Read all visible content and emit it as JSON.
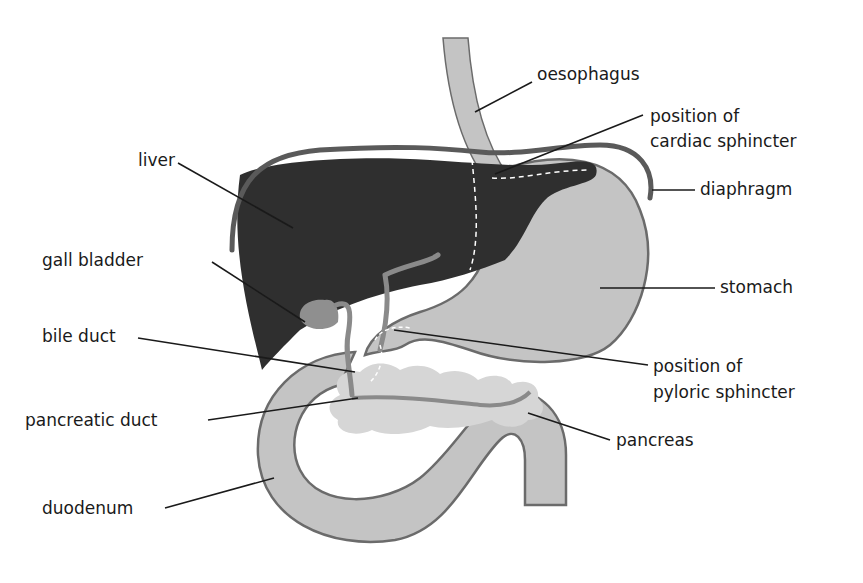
{
  "diagram": {
    "colors": {
      "liver": "#2f2f2f",
      "organ_fill": "#c4c4c4",
      "organ_outline": "#6b6b6b",
      "pancreas": "#d6d6d6",
      "gall_bladder": "#8f8f8f",
      "duct": "#8a8a8a",
      "diaphragm": "#5a5a5a",
      "leader": "#1a1a1a"
    },
    "labels": {
      "oesophagus": "oesophagus",
      "cardiac_1": "position of",
      "cardiac_2": "cardiac sphincter",
      "liver": "liver",
      "diaphragm": "diaphragm",
      "gall_bladder": "gall bladder",
      "stomach": "stomach",
      "bile_duct": "bile duct",
      "pyloric_1": "position of",
      "pyloric_2": "pyloric sphincter",
      "pancreatic_duct": "pancreatic duct",
      "pancreas": "pancreas",
      "duodenum": "duodenum"
    }
  }
}
